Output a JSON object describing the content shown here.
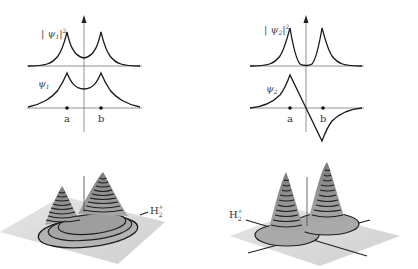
{
  "left_panel": {
    "density_label": "|ψ1|²",
    "density_label_main": "| ψ",
    "density_label_sub": "1",
    "density_label_sup": "2",
    "wave_label_main": "ψ",
    "wave_label_sub": "1",
    "nucleus_a": "a",
    "nucleus_b": "b",
    "surface_label_main": "H",
    "surface_label_sub": "2",
    "surface_label_sup": "+"
  },
  "right_panel": {
    "density_label": "|ψ2|²",
    "density_label_main": "| ψ",
    "density_label_sub": "2",
    "density_label_sup": "2",
    "wave_label_main": "ψ",
    "wave_label_sub": "2",
    "nucleus_a": "a",
    "nucleus_b": "b",
    "surface_label_main": "H",
    "surface_label_sub": "2",
    "surface_label_sup": "+"
  },
  "colors": {
    "curve": "#1a1a1a",
    "axis": "#777777",
    "plane": "#d9d9d9",
    "surface": "#9a9a9a",
    "contour": "#1e1e1e"
  }
}
